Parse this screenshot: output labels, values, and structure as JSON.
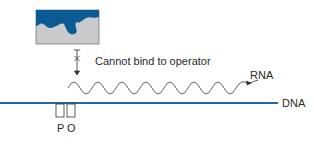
{
  "diagram": {
    "repressor": {
      "label": "",
      "fill": "#c8cacc",
      "blob_color": "#0a5a94"
    },
    "blocked_annotation": "Cannot bind to operator",
    "rna_label": "RNA",
    "dna_label": "DNA",
    "promoter_label": "P",
    "operator_label": "O",
    "colors": {
      "dna_line": "#1f6aa5",
      "text": "#2a2a2a",
      "stroke": "#333333"
    }
  }
}
